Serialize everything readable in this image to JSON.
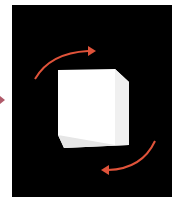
{
  "scene": {
    "background_color": "#000000",
    "cube_color": "#ffffff",
    "cube_edge_color": "#d9d9d9",
    "arrow_color": "#e0533a",
    "icons": [
      "rotate-clockwise-arrow-top",
      "rotate-clockwise-arrow-bottom",
      "cube-icon"
    ]
  },
  "side_marker_color": "#b05a6a"
}
